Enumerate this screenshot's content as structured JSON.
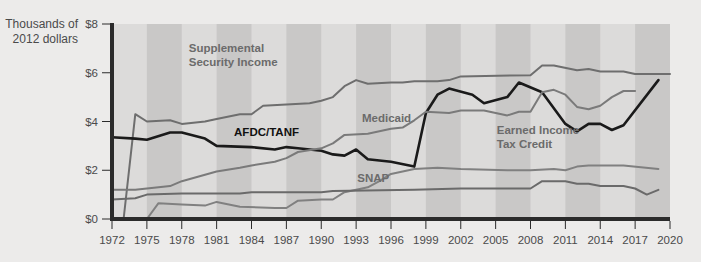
{
  "chart_data": {
    "type": "line",
    "title": "",
    "ylabel": "Thousands of 2012 dollars",
    "ylabel_lines": [
      "Thousands of",
      "2012 dollars"
    ],
    "xlabel": "",
    "xlim": [
      1972,
      2020
    ],
    "ylim": [
      0,
      8
    ],
    "y_ticks": [
      0,
      2,
      4,
      6,
      8
    ],
    "y_tick_labels": [
      "$0",
      "$2",
      "$4",
      "$6",
      "$8"
    ],
    "x_ticks": [
      1972,
      1975,
      1978,
      1981,
      1984,
      1987,
      1990,
      1993,
      1996,
      1999,
      2002,
      2005,
      2008,
      2011,
      2014,
      2017,
      2020
    ],
    "shaded_bands": [
      [
        1975,
        1978
      ],
      [
        1981,
        1984
      ],
      [
        1987,
        1990
      ],
      [
        1993,
        1996
      ],
      [
        1999,
        2002
      ],
      [
        2005,
        2008
      ],
      [
        2011,
        2014
      ],
      [
        2017,
        2020
      ]
    ],
    "grid": false,
    "legend": "inline labels",
    "series": [
      {
        "name": "Supplemental Security Income",
        "label_lines": [
          "Supplemental",
          "Security Income"
        ],
        "label_pos": [
          1978.6,
          6.85
        ],
        "color": "#6e6e6e",
        "width": 2,
        "points": [
          [
            1973,
            0
          ],
          [
            1974,
            4.3
          ],
          [
            1975,
            4.0
          ],
          [
            1977,
            4.05
          ],
          [
            1978,
            3.9
          ],
          [
            1980,
            4.0
          ],
          [
            1981,
            4.1
          ],
          [
            1983,
            4.3
          ],
          [
            1984,
            4.3
          ],
          [
            1985,
            4.65
          ],
          [
            1987,
            4.7
          ],
          [
            1989,
            4.75
          ],
          [
            1990,
            4.85
          ],
          [
            1991,
            5.0
          ],
          [
            1992,
            5.45
          ],
          [
            1993,
            5.7
          ],
          [
            1994,
            5.55
          ],
          [
            1996,
            5.6
          ],
          [
            1997,
            5.6
          ],
          [
            1998,
            5.65
          ],
          [
            2000,
            5.65
          ],
          [
            2001,
            5.7
          ],
          [
            2002,
            5.85
          ],
          [
            2008,
            5.9
          ],
          [
            2009,
            6.3
          ],
          [
            2010,
            6.3
          ],
          [
            2012,
            6.1
          ],
          [
            2013,
            6.15
          ],
          [
            2014,
            6.05
          ],
          [
            2016,
            6.05
          ],
          [
            2017,
            5.95
          ],
          [
            2020,
            5.95
          ]
        ]
      },
      {
        "name": "AFDC/TANF",
        "label_lines": [
          "AFDC/TANF"
        ],
        "label_pos": [
          1982.5,
          3.4
        ],
        "color": "#1a1a1a",
        "width": 2.6,
        "points": [
          [
            1972,
            3.35
          ],
          [
            1974,
            3.3
          ],
          [
            1975,
            3.25
          ],
          [
            1977,
            3.55
          ],
          [
            1978,
            3.55
          ],
          [
            1980,
            3.3
          ],
          [
            1981,
            3.0
          ],
          [
            1984,
            2.95
          ],
          [
            1986,
            2.85
          ],
          [
            1987,
            2.95
          ],
          [
            1988,
            2.9
          ],
          [
            1990,
            2.8
          ],
          [
            1991,
            2.65
          ],
          [
            1992,
            2.6
          ],
          [
            1993,
            2.85
          ],
          [
            1994,
            2.45
          ],
          [
            1996,
            2.35
          ],
          [
            1998,
            2.15
          ],
          [
            1999,
            4.35
          ],
          [
            2000,
            5.1
          ],
          [
            2001,
            5.35
          ],
          [
            2003,
            5.1
          ],
          [
            2004,
            4.75
          ],
          [
            2006,
            5.0
          ],
          [
            2007,
            5.6
          ],
          [
            2009,
            5.2
          ],
          [
            2011,
            3.9
          ],
          [
            2012,
            3.6
          ],
          [
            2013,
            3.9
          ],
          [
            2014,
            3.9
          ],
          [
            2015,
            3.65
          ],
          [
            2016,
            3.85
          ],
          [
            2019,
            5.7
          ]
        ]
      },
      {
        "name": "Medicaid",
        "label_lines": [
          "Medicaid"
        ],
        "label_pos": [
          1993.5,
          4.0
        ],
        "color": "#7a7a7a",
        "width": 2,
        "points": [
          [
            1972,
            1.2
          ],
          [
            1974,
            1.2
          ],
          [
            1975,
            1.25
          ],
          [
            1977,
            1.35
          ],
          [
            1978,
            1.55
          ],
          [
            1981,
            1.95
          ],
          [
            1983,
            2.1
          ],
          [
            1984,
            2.2
          ],
          [
            1986,
            2.35
          ],
          [
            1987,
            2.5
          ],
          [
            1988,
            2.75
          ],
          [
            1990,
            2.9
          ],
          [
            1991,
            3.1
          ],
          [
            1992,
            3.45
          ],
          [
            1994,
            3.5
          ],
          [
            1996,
            3.7
          ],
          [
            1997,
            3.75
          ],
          [
            1998,
            4.05
          ],
          [
            1999,
            4.4
          ],
          [
            2001,
            4.35
          ],
          [
            2002,
            4.45
          ],
          [
            2004,
            4.45
          ],
          [
            2006,
            4.25
          ],
          [
            2007,
            4.4
          ],
          [
            2008,
            4.4
          ],
          [
            2009,
            5.2
          ],
          [
            2010,
            5.3
          ],
          [
            2011,
            5.1
          ],
          [
            2012,
            4.6
          ],
          [
            2013,
            4.5
          ],
          [
            2014,
            4.65
          ],
          [
            2015,
            5.0
          ],
          [
            2016,
            5.25
          ],
          [
            2017,
            5.25
          ]
        ]
      },
      {
        "name": "Earned Income Tax Credit",
        "label_lines": [
          "Earned Income",
          "Tax Credit"
        ],
        "label_pos": [
          2005.1,
          3.5
        ],
        "color": "#808080",
        "width": 2,
        "points": [
          [
            1975,
            0
          ],
          [
            1976,
            0.65
          ],
          [
            1978,
            0.6
          ],
          [
            1980,
            0.55
          ],
          [
            1981,
            0.7
          ],
          [
            1983,
            0.5
          ],
          [
            1986,
            0.45
          ],
          [
            1987,
            0.45
          ],
          [
            1988,
            0.75
          ],
          [
            1990,
            0.8
          ],
          [
            1991,
            0.8
          ],
          [
            1992,
            1.1
          ],
          [
            1994,
            1.3
          ],
          [
            1995,
            1.55
          ],
          [
            1996,
            1.85
          ],
          [
            1998,
            2.05
          ],
          [
            2000,
            2.1
          ],
          [
            2002,
            2.05
          ],
          [
            2006,
            2.0
          ],
          [
            2008,
            2.0
          ],
          [
            2010,
            2.05
          ],
          [
            2011,
            2.0
          ],
          [
            2012,
            2.15
          ],
          [
            2013,
            2.2
          ],
          [
            2016,
            2.2
          ],
          [
            2019,
            2.05
          ]
        ]
      },
      {
        "name": "SNAP",
        "label_lines": [
          "SNAP"
        ],
        "label_pos": [
          1993.1,
          1.5
        ],
        "color": "#6a6a6a",
        "width": 2,
        "points": [
          [
            1972,
            0.8
          ],
          [
            1974,
            0.85
          ],
          [
            1975,
            1.0
          ],
          [
            1978,
            1.05
          ],
          [
            1983,
            1.05
          ],
          [
            1984,
            1.1
          ],
          [
            1990,
            1.1
          ],
          [
            1991,
            1.15
          ],
          [
            1998,
            1.2
          ],
          [
            2002,
            1.25
          ],
          [
            2008,
            1.25
          ],
          [
            2009,
            1.55
          ],
          [
            2011,
            1.55
          ],
          [
            2012,
            1.45
          ],
          [
            2013,
            1.45
          ],
          [
            2014,
            1.35
          ],
          [
            2016,
            1.35
          ],
          [
            2017,
            1.25
          ],
          [
            2018,
            1.0
          ],
          [
            2019,
            1.2
          ]
        ]
      }
    ]
  },
  "colors": {
    "background": "#ecebea",
    "band_light": "#dcdbda",
    "band_dark": "#c9c8c7",
    "axis": "#2b2b2b",
    "text": "#4a4a4a",
    "label_gray": "#6b6b6b",
    "label_black": "#111111"
  }
}
